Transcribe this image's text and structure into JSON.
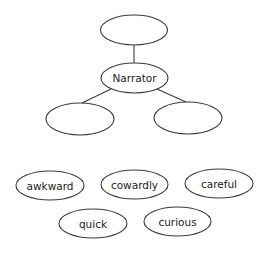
{
  "diagram": {
    "type": "tree-with-word-bank",
    "colors": {
      "stroke": "#3a3a3a",
      "text": "#222222",
      "background": "#ffffff"
    },
    "tree": {
      "top": {
        "label": ""
      },
      "center": {
        "label": "Narrator"
      },
      "left": {
        "label": ""
      },
      "right": {
        "label": ""
      }
    },
    "word_bank": [
      {
        "label": "awkward"
      },
      {
        "label": "cowardly"
      },
      {
        "label": "careful"
      },
      {
        "label": "quick"
      },
      {
        "label": "curious"
      }
    ]
  }
}
